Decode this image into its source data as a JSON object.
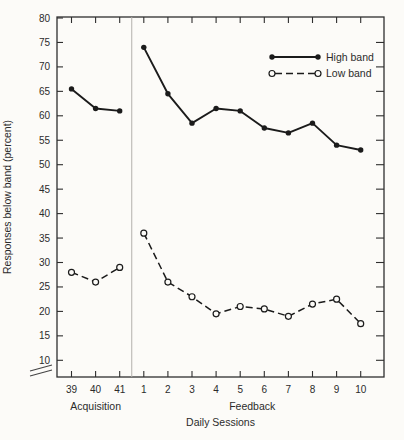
{
  "page": {
    "background": "#fcfbf8",
    "ink_color": "#1b1b1b",
    "frame_color": "#2e2e2e",
    "divider_color": "#b3b1ad"
  },
  "chart_data": {
    "type": "line",
    "title": "",
    "xlabel": "Daily Sessions",
    "ylabel": "Responses below band (percent)",
    "ylim": [
      10,
      80
    ],
    "ytick_step": 5,
    "grid": false,
    "axis_break": true,
    "legend_position": "top-right",
    "categories": [
      "39",
      "40",
      "41",
      "1",
      "2",
      "3",
      "4",
      "5",
      "6",
      "7",
      "8",
      "9",
      "10"
    ],
    "phases": [
      {
        "label": "Acquisition",
        "start": 0,
        "end": 2
      },
      {
        "label": "Feedback",
        "start": 3,
        "end": 12
      }
    ],
    "phase_divider_after_index": 2,
    "series": [
      {
        "name": "High band",
        "line_style": "solid",
        "marker": "filled-circle",
        "color": "#1b1b1b",
        "values": [
          65.5,
          61.5,
          61,
          74,
          64.5,
          58.5,
          61.5,
          61,
          57.5,
          56.5,
          58.5,
          54,
          53
        ]
      },
      {
        "name": "Low band",
        "line_style": "dashed",
        "marker": "open-circle",
        "color": "#1b1b1b",
        "values": [
          28,
          26,
          29,
          36,
          26,
          23,
          19.5,
          21,
          20.5,
          19,
          21.5,
          22.5,
          17.5
        ]
      }
    ]
  }
}
